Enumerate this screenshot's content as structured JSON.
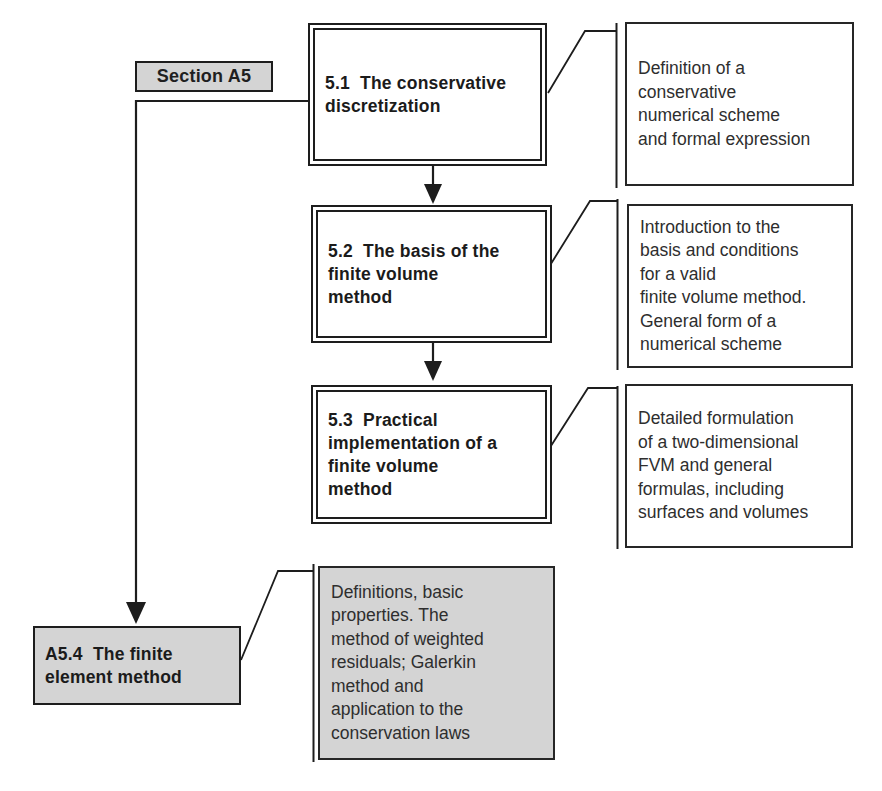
{
  "diagram": {
    "section_label": "Section A5",
    "boxes": [
      {
        "id": "5.1",
        "title": "5.1  The conservative\ndiscretization",
        "note": "Definition of a\nconservative\nnumerical scheme\nand formal expression"
      },
      {
        "id": "5.2",
        "title": "5.2  The basis of the\nfinite volume\nmethod",
        "note": "Introduction to the\nbasis and conditions\nfor a valid\nfinite volume method.\nGeneral form of a\nnumerical scheme"
      },
      {
        "id": "5.3",
        "title": "5.3  Practical\nimplementation of a\nfinite volume\nmethod",
        "note": "Detailed formulation\nof a two-dimensional\nFVM and general\nformulas, including\nsurfaces and volumes"
      },
      {
        "id": "A5.4",
        "title": "A5.4  The finite\nelement method",
        "note": "Definitions, basic\nproperties. The\nmethod of weighted\nresiduals; Galerkin\nmethod and\napplication to the\nconservation laws"
      }
    ],
    "colors": {
      "background": "#ffffff",
      "gray_fill": "#d4d4d4",
      "line": "#1d1d1d",
      "note_fill": "#ffffff"
    }
  }
}
